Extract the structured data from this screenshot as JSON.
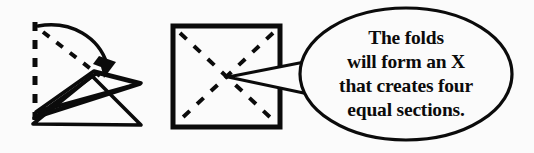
{
  "figure": {
    "kind": "paper-folding-instruction-diagram",
    "background_color": "#fbfbfb",
    "ink_color": "#0b0b0b"
  },
  "panels": {
    "fold_step": {
      "name": "folded-paper-panel",
      "fold_line_style": "dashed",
      "arrow": {
        "name": "fold-direction-arrow",
        "style": "curved-solid-arrow",
        "direction": "top-left to bottom-right"
      }
    },
    "square_step": {
      "name": "creased-square-panel",
      "border_style": "solid",
      "diagonals": {
        "name": "crease-diagonals",
        "style": "dashed",
        "count": 2,
        "shape": "X"
      }
    }
  },
  "callout": {
    "name": "speech-bubble",
    "shape": "ellipse",
    "tail_points_to": "square-center",
    "lines": [
      "The folds",
      "will form an X",
      "that creates four",
      "equal sections."
    ],
    "full_text": "The folds will form an X that creates four equal sections."
  }
}
